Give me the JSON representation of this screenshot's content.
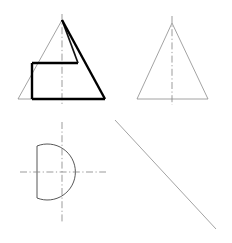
{
  "sheet": {
    "title": "Orthographic Projection Sheet",
    "width": 232,
    "height": 243,
    "background": "#ffffff",
    "line_colors": {
      "visible_thick": "#000000",
      "visible_medium": "#121212",
      "visible_thin": "#444444",
      "faint": "#8b8b8b",
      "center": "#8a8a8a"
    }
  },
  "views": {
    "front": {
      "name": "front-view",
      "label": "Front View",
      "quadrant": "top-left",
      "outer_triangle": {
        "apex": [
          62,
          20
        ],
        "base_left": [
          18,
          99
        ],
        "base_right": [
          105,
          99
        ]
      },
      "centerline": {
        "x": 62,
        "y_top": 14,
        "y_bottom": 104
      },
      "inner_solid": {
        "top_edge_y": 63,
        "top_edge_left_x": 32,
        "top_edge_right_x": 78,
        "left_edge_x": 32,
        "bottom_y": 99,
        "bottom_right_x": 105
      }
    },
    "side": {
      "name": "side-view",
      "label": "Side View",
      "quadrant": "top-right",
      "triangle": {
        "apex": [
          172,
          23
        ],
        "base_left": [
          137,
          99
        ],
        "base_right": [
          208,
          99
        ]
      },
      "centerline": {
        "x": 172,
        "y_top": 16,
        "y_bottom": 105
      }
    },
    "top": {
      "name": "top-view",
      "label": "Top View",
      "quadrant": "bottom-left",
      "d_shape": {
        "center": [
          62,
          172
        ],
        "radius": 28,
        "flat_left_x": 37,
        "flat_top_y": 146,
        "flat_bottom_y": 198
      },
      "centerline_vertical": {
        "x": 62,
        "y_top": 122,
        "y_bottom": 222
      },
      "centerline_horizontal": {
        "y": 172,
        "x_left": 20,
        "x_right": 106
      }
    },
    "auxiliary": {
      "name": "auxiliary-view",
      "label": "Auxiliary Projection Line",
      "quadrant": "bottom-right",
      "line": {
        "start": [
          115,
          120
        ],
        "end": [
          216,
          229
        ]
      }
    }
  }
}
